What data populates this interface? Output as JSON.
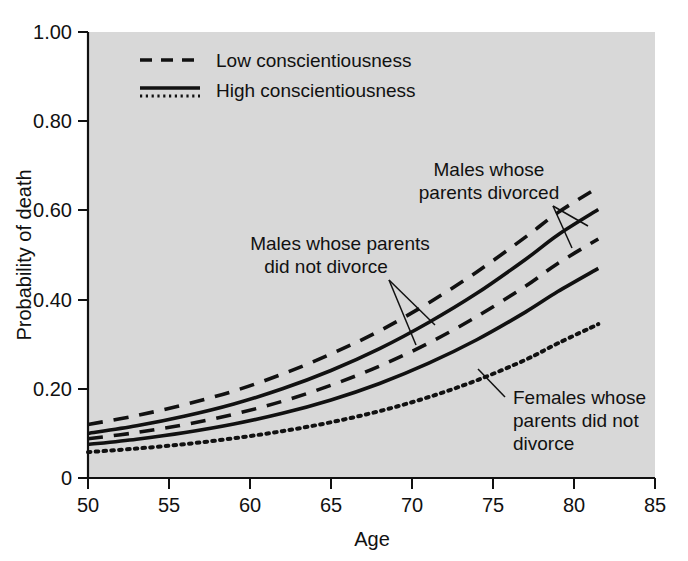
{
  "chart_data": {
    "type": "line",
    "title": "",
    "xlabel": "Age",
    "ylabel": "Probability of death",
    "xlim": [
      50,
      85
    ],
    "ylim": [
      0,
      1.0
    ],
    "xticks": [
      "50",
      "55",
      "60",
      "65",
      "70",
      "75",
      "80",
      "85"
    ],
    "xtick_values": [
      50,
      55,
      60,
      65,
      70,
      75,
      80,
      85
    ],
    "yticks": [
      "0",
      "0.20",
      "0.40",
      "0.60",
      "0.80",
      "1.00"
    ],
    "ytick_values": [
      0,
      0.2,
      0.4,
      0.6,
      0.8,
      1.0
    ],
    "grid": false,
    "legend_position": "top-left-inside",
    "plot_background": "#d8d8d8",
    "line_color": "#111111",
    "x": [
      50,
      53,
      56,
      59,
      62,
      65,
      68,
      71,
      74,
      77,
      79,
      81.5
    ],
    "series": [
      {
        "name": "Males whose parents divorced - Low conscientiousness",
        "style": "dashed",
        "values": [
          0.12,
          0.14,
          0.165,
          0.195,
          0.233,
          0.278,
          0.33,
          0.392,
          0.462,
          0.54,
          0.595,
          0.652
        ]
      },
      {
        "name": "Males whose parents divorced - High conscientiousness",
        "style": "solid",
        "values": [
          0.1,
          0.117,
          0.139,
          0.166,
          0.2,
          0.241,
          0.29,
          0.348,
          0.414,
          0.49,
          0.545,
          0.602
        ]
      },
      {
        "name": "Males whose parents did not divorce - Low conscientiousness",
        "style": "dashed",
        "values": [
          0.088,
          0.102,
          0.12,
          0.143,
          0.172,
          0.208,
          0.251,
          0.302,
          0.362,
          0.43,
          0.481,
          0.536
        ]
      },
      {
        "name": "Males whose parents did not divorce - High conscientiousness",
        "style": "solid",
        "values": [
          0.075,
          0.087,
          0.102,
          0.121,
          0.145,
          0.175,
          0.212,
          0.257,
          0.31,
          0.372,
          0.418,
          0.47
        ]
      },
      {
        "name": "Females whose parents did not divorce",
        "style": "dotted",
        "values": [
          0.058,
          0.066,
          0.076,
          0.089,
          0.105,
          0.125,
          0.15,
          0.181,
          0.219,
          0.265,
          0.302,
          0.345
        ]
      }
    ],
    "legend": [
      {
        "label": "Low conscientiousness",
        "style": "dashed"
      },
      {
        "label": "High conscientiousness",
        "style": "solid-and-dotted"
      }
    ],
    "annotations": [
      {
        "id": "males-divorced",
        "lines": [
          "Males whose",
          "parents divorced"
        ],
        "text": "Males whose parents divorced"
      },
      {
        "id": "males-not-divorced",
        "lines": [
          "Males whose parents",
          "did not divorce"
        ],
        "text": "Males whose parents did not divorce"
      },
      {
        "id": "females-not-divorced",
        "lines": [
          "Females whose",
          "parents did not",
          "divorce"
        ],
        "text": "Females whose parents did not divorce"
      }
    ]
  },
  "axis": {
    "y_title": "Probability of death",
    "x_title": "Age",
    "yticks": [
      "1.00",
      "0.80",
      "0.60",
      "0.40",
      "0.20",
      "0"
    ],
    "xticks": [
      "50",
      "55",
      "60",
      "65",
      "70",
      "75",
      "80",
      "85"
    ]
  },
  "legend": {
    "low_label": "Low conscientiousness",
    "high_label": "High conscientiousness"
  },
  "annotations": {
    "males_divorced_l1": "Males whose",
    "males_divorced_l2": "parents divorced",
    "males_not_divorced_l1": "Males whose parents",
    "males_not_divorced_l2": "did not divorce",
    "females_l1": "Females whose",
    "females_l2": "parents did not",
    "females_l3": "divorce"
  },
  "colors": {
    "plot_background": "#d8d8d8",
    "page_background": "#ffffff",
    "line": "#111111",
    "text": "#111111"
  }
}
